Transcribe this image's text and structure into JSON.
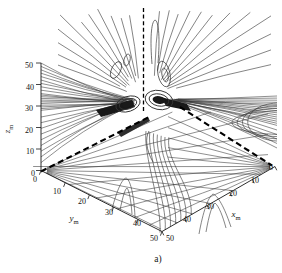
{
  "figure": {
    "caption": "a)",
    "background": "#ffffff",
    "ink": "#161616",
    "contour_color": "#333333",
    "dashed_color": "#000000"
  },
  "chart_data": {
    "type": "contour",
    "view": "3d-box, contour lines drawn on left wall, right wall and floor",
    "title": "",
    "panel_label": "a)",
    "contour_levels_labeled": false,
    "axes": {
      "x": {
        "base": "x",
        "sub": "m",
        "range": [
          0,
          50
        ],
        "ticks": [
          0,
          10,
          20,
          30,
          40,
          50
        ]
      },
      "y": {
        "base": "y",
        "sub": "m",
        "range": [
          0,
          50
        ],
        "ticks": [
          0,
          10,
          20,
          30,
          40,
          50
        ]
      },
      "z": {
        "base": "z",
        "sub": "m",
        "range": [
          0,
          50
        ],
        "ticks": [
          0,
          10,
          20,
          30,
          40,
          50
        ]
      }
    }
  }
}
